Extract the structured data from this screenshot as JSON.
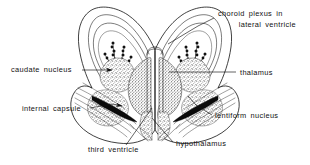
{
  "figure": {
    "type": "anatomical-diagram",
    "background_color": "#ffffff",
    "ink_color": "#111111",
    "width": 310,
    "height": 165
  },
  "labels": [
    {
      "id": "choroid-plexus",
      "line1": "choroid  plexus  in",
      "line2": "lateral  ventricle",
      "x1": 218,
      "y1": 16,
      "x2": 218,
      "y2": 27,
      "anchor": "start",
      "leader": "M214,18 L198,26 L168,44",
      "arrow": false
    },
    {
      "id": "caudate-nucleus",
      "line1": "caudate  nucleus",
      "line2": "",
      "x1": 11,
      "y1": 72,
      "x2": 0,
      "y2": 0,
      "anchor": "start",
      "leader": "M82,70 L112,70",
      "arrow": true
    },
    {
      "id": "thalamus",
      "line1": "thalamus",
      "line2": "",
      "x1": 240,
      "y1": 75,
      "x2": 0,
      "y2": 0,
      "anchor": "start",
      "leader": "M236,72 L169,72",
      "arrow": false
    },
    {
      "id": "internal-capsule",
      "line1": "internal  capsule",
      "line2": "",
      "x1": 22,
      "y1": 111,
      "x2": 0,
      "y2": 0,
      "anchor": "start",
      "leader": "M90,108 L112,104 L122,105",
      "arrow": true
    },
    {
      "id": "lentiform-nucleus",
      "line1": "lentiform  nucleus",
      "line2": "",
      "x1": 215,
      "y1": 118,
      "x2": 0,
      "y2": 0,
      "anchor": "start",
      "leader": "M212,115 L196,105 L188,96",
      "arrow": false
    },
    {
      "id": "third-ventricle",
      "line1": "third  ventricle",
      "line2": "",
      "x1": 88,
      "y1": 152,
      "x2": 0,
      "y2": 0,
      "anchor": "start",
      "leader": "M126,145 L152,108",
      "arrow": false
    },
    {
      "id": "hypothalamus",
      "line1": "hypothalamus",
      "line2": "",
      "x1": 176,
      "y1": 146,
      "x2": 0,
      "y2": 0,
      "anchor": "start",
      "leader": "M173,142 L158,125 L152,118",
      "arrow": false
    }
  ],
  "structures": [
    {
      "id": "cerebral-outline",
      "name": "cerebral hemisphere outline"
    },
    {
      "id": "lateral-ventricle-left",
      "name": "left lateral ventricle"
    },
    {
      "id": "lateral-ventricle-right",
      "name": "right lateral ventricle"
    },
    {
      "id": "choroid-plexus-left",
      "name": "left choroid plexus"
    },
    {
      "id": "choroid-plexus-right",
      "name": "right choroid plexus"
    },
    {
      "id": "caudate-nucleus-left",
      "name": "left caudate nucleus"
    },
    {
      "id": "caudate-nucleus-right",
      "name": "right caudate nucleus"
    },
    {
      "id": "thalamus-left",
      "name": "left thalamus"
    },
    {
      "id": "thalamus-right",
      "name": "right thalamus"
    },
    {
      "id": "internal-capsule-left",
      "name": "left internal capsule"
    },
    {
      "id": "internal-capsule-right",
      "name": "right internal capsule"
    },
    {
      "id": "lentiform-nucleus-left",
      "name": "left lentiform nucleus"
    },
    {
      "id": "lentiform-nucleus-right",
      "name": "right lentiform nucleus"
    },
    {
      "id": "third-ventricle",
      "name": "third ventricle"
    },
    {
      "id": "hypothalamus",
      "name": "hypothalamus"
    }
  ]
}
